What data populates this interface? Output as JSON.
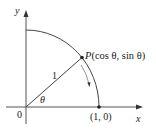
{
  "diagram": {
    "type": "unit-circle-quadrant",
    "axes": {
      "x_label": "x",
      "y_label": "y",
      "origin_label": "0"
    },
    "radius_label": "1",
    "angle_label": "θ",
    "point_p": {
      "name": "P",
      "coords_text": "(cos θ, sin θ)"
    },
    "point_on_x_axis": {
      "coords_text": "(1, 0)"
    },
    "colors": {
      "stroke": "#444444",
      "text": "#222222",
      "background": "#ffffff"
    }
  }
}
